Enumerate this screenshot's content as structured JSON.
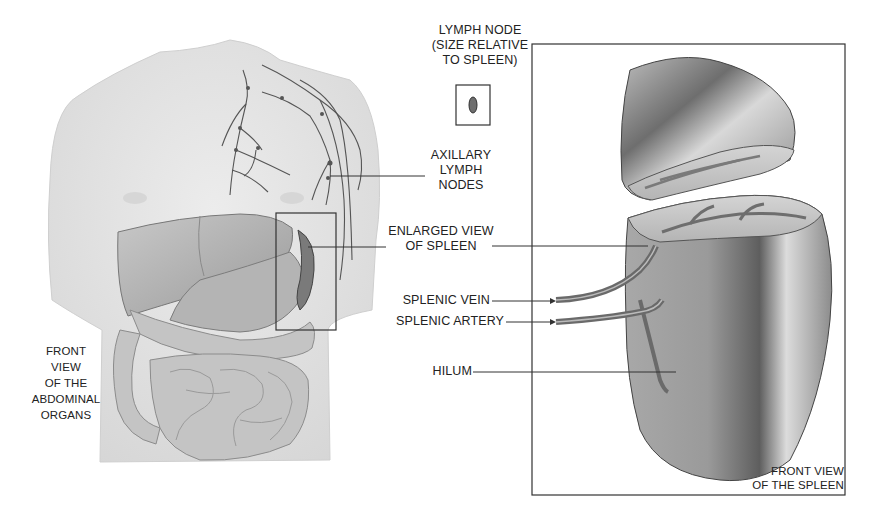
{
  "diagram": {
    "labels": {
      "lymph_node_size": [
        "LYMPH NODE",
        "(SIZE RELATIVE",
        "TO SPLEEN)"
      ],
      "axillary_lymph_nodes": [
        "AXILLARY",
        "LYMPH",
        "NODES"
      ],
      "enlarged_view": [
        "ENLARGED VIEW",
        "OF SPLEEN"
      ],
      "splenic_vein": "SPLENIC VEIN",
      "splenic_artery": "SPLENIC ARTERY",
      "hilum": "HILUM",
      "front_view_abdominal": [
        "FRONT",
        "VIEW",
        "OF THE",
        "ABDOMINAL",
        "ORGANS"
      ],
      "front_view_spleen": [
        "FRONT VIEW",
        "OF THE SPLEEN"
      ]
    },
    "panels": [
      {
        "name": "torso",
        "caption": "FRONT VIEW OF THE ABDOMINAL ORGANS"
      },
      {
        "name": "spleen-enlarged",
        "caption": "FRONT VIEW OF THE SPLEEN"
      }
    ],
    "colors": {
      "skin": "#e6e6e6",
      "organ": "#b8b8b8",
      "organ_dark": "#8a8a8a",
      "line": "#333333",
      "vessel": "#6b6b6b"
    }
  }
}
